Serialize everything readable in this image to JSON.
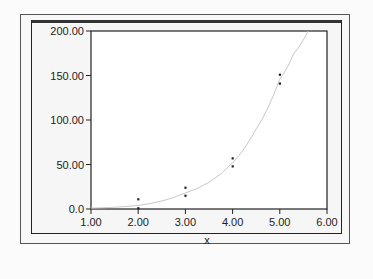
{
  "chart_data": {
    "type": "scatter",
    "title": "",
    "xlabel": "x",
    "ylabel": "",
    "xlim": [
      1.0,
      6.0
    ],
    "ylim": [
      0.0,
      200.0
    ],
    "x_ticks": [
      "1.00",
      "2.00",
      "3.00",
      "4.00",
      "5.00",
      "6.00"
    ],
    "y_ticks": [
      "0.0",
      "50.00",
      "100.00",
      "150.00",
      "200.00"
    ],
    "grid": false,
    "legend": null,
    "series": [
      {
        "name": "observed",
        "kind": "scatter",
        "points": [
          {
            "x": 2.0,
            "y": 11
          },
          {
            "x": 2.0,
            "y": 1
          },
          {
            "x": 3.0,
            "y": 24
          },
          {
            "x": 3.0,
            "y": 15
          },
          {
            "x": 4.0,
            "y": 57
          },
          {
            "x": 4.0,
            "y": 48
          },
          {
            "x": 5.0,
            "y": 151
          },
          {
            "x": 5.0,
            "y": 141
          }
        ]
      },
      {
        "name": "fitted curve",
        "kind": "line",
        "points": [
          {
            "x": 1.0,
            "y": 1
          },
          {
            "x": 1.5,
            "y": 2
          },
          {
            "x": 2.0,
            "y": 4
          },
          {
            "x": 2.5,
            "y": 9
          },
          {
            "x": 3.0,
            "y": 18
          },
          {
            "x": 3.5,
            "y": 30
          },
          {
            "x": 4.0,
            "y": 52
          },
          {
            "x": 4.5,
            "y": 90
          },
          {
            "x": 5.0,
            "y": 146
          },
          {
            "x": 5.3,
            "y": 175
          },
          {
            "x": 5.6,
            "y": 200
          }
        ]
      }
    ]
  },
  "colors": {
    "axis": "#222222",
    "points": "#222222",
    "curve": "#c8c8c8",
    "background": "#f6f6f6"
  }
}
